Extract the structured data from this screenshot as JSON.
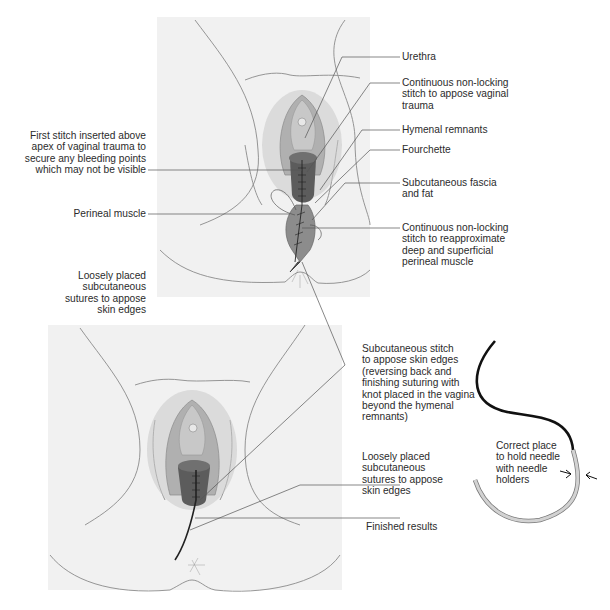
{
  "figure": {
    "panels": [
      {
        "id": "top",
        "description": "Repair of perineal muscle with continuous non-locking stitch"
      },
      {
        "id": "bottom",
        "description": "Finished subcuticular skin repair"
      }
    ],
    "labels": {
      "urethra": "Urethra",
      "continuous_vaginal": "Continuous non-locking stitch to appose vaginal trauma",
      "hymenal_remnants": "Hymenal remnants",
      "fourchette": "Fourchette",
      "subcutaneous_fascia": "Subcutaneous fascia and fat",
      "continuous_perineal": "Continuous non-locking stitch to reapproximate deep and superficial perineal muscle",
      "first_stitch": "First stitch inserted above apex of vaginal trauma to secure any bleeding points which may not be visible",
      "perineal_muscle": "Perineal muscle",
      "loosely_placed_left": "Loosely placed subcutaneous sutures to appose skin edges",
      "subcutaneous_stitch": "Subcutaneous stitch to appose skin edges (reversing back and finishing suturing with knot placed in the vagina beyond the hymenal remnants)",
      "loosely_placed_right": "Loosely placed subcutaneous sutures to appose skin edges",
      "finished_results": "Finished results",
      "needle_hold": "Correct place to hold needle with needle holders"
    },
    "label_lines": {
      "urethra": [
        "Urethra"
      ],
      "continuous_vaginal": [
        "Continuous non-locking",
        "stitch to appose vaginal",
        "trauma"
      ],
      "hymenal_remnants": [
        "Hymenal remnants"
      ],
      "fourchette": [
        "Fourchette"
      ],
      "subcutaneous_fascia": [
        "Subcutaneous fascia",
        "and fat"
      ],
      "continuous_perineal": [
        "Continuous non-locking",
        "stitch to reapproximate",
        "deep and superficial",
        "perineal muscle"
      ],
      "first_stitch": [
        "First stitch inserted above",
        "apex of vaginal trauma to",
        "secure any bleeding points",
        "which may not be visible"
      ],
      "perineal_muscle": [
        "Perineal muscle"
      ],
      "loosely_placed_left": [
        "Loosely placed",
        "subcutaneous",
        "sutures to appose",
        "skin edges"
      ],
      "subcutaneous_stitch": [
        "Subcutaneous stitch",
        "to appose skin edges",
        "(reversing back and",
        "finishing suturing with",
        "knot placed in the vagina",
        "beyond the hymenal",
        "remnants)"
      ],
      "loosely_placed_right": [
        "Loosely placed",
        "subcutaneous",
        "sutures to appose",
        "skin edges"
      ],
      "finished_results": [
        "Finished results"
      ],
      "needle_hold": [
        "Correct place",
        "to hold needle",
        "with needle",
        "holders"
      ]
    },
    "colors": {
      "panel_bg": "#f1f1f1",
      "outline": "#8a8a8a",
      "tissue_dark": "#5a5a5a",
      "tissue_mid": "#9a9a9a",
      "tissue_light": "#c4c4c4",
      "leader": "#555555",
      "suture": "#111111",
      "needle": "#d2d2d2"
    }
  }
}
